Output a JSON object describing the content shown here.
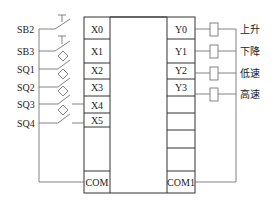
{
  "diagram": {
    "inputs": [
      {
        "device": "SB2",
        "terminal": "X0",
        "symbol": "pushbutton-no"
      },
      {
        "device": "SB3",
        "terminal": "X1",
        "symbol": "pushbutton-nc"
      },
      {
        "device": "SQ1",
        "terminal": "X2",
        "symbol": "limit-switch"
      },
      {
        "device": "SQ2",
        "terminal": "X3",
        "symbol": "limit-switch"
      },
      {
        "device": "SQ3",
        "terminal": "X4",
        "symbol": "limit-switch"
      },
      {
        "device": "SQ4",
        "terminal": "X5",
        "symbol": "limit-switch"
      }
    ],
    "input_common": "COM",
    "outputs": [
      {
        "terminal": "Y0",
        "load": "上升"
      },
      {
        "terminal": "Y1",
        "load": "下降"
      },
      {
        "terminal": "Y2",
        "load": "低速"
      },
      {
        "terminal": "Y3",
        "load": "高速"
      }
    ],
    "output_common": "COM1"
  }
}
